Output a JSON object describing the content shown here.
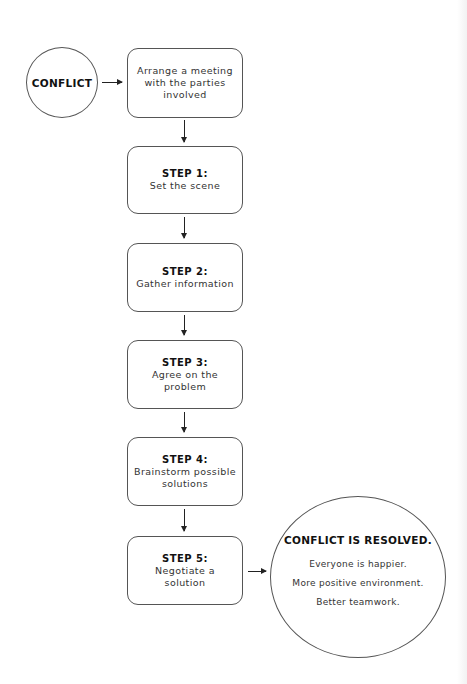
{
  "start": {
    "label": "CONFLICT"
  },
  "first_action": {
    "text": "Arrange a meeting with the parties involved"
  },
  "steps": [
    {
      "title": "STEP 1:",
      "text": "Set the scene"
    },
    {
      "title": "STEP 2:",
      "text": "Gather information"
    },
    {
      "title": "STEP 3:",
      "text": "Agree on the problem"
    },
    {
      "title": "STEP 4:",
      "text": "Brainstorm possible solutions"
    },
    {
      "title": "STEP 5:",
      "text": "Negotiate a solution"
    }
  ],
  "outcome": {
    "title": "CONFLICT IS RESOLVED.",
    "benefits": [
      "Everyone is happier.",
      "More positive environment.",
      "Better teamwork."
    ]
  }
}
